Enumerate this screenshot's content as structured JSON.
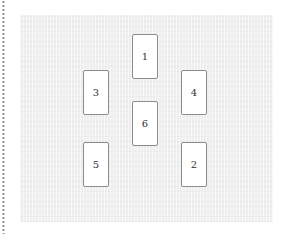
{
  "spread": {
    "cards": [
      {
        "id": "card-1",
        "label": "1"
      },
      {
        "id": "card-2",
        "label": "2"
      },
      {
        "id": "card-3",
        "label": "3"
      },
      {
        "id": "card-4",
        "label": "4"
      },
      {
        "id": "card-5",
        "label": "5"
      },
      {
        "id": "card-6",
        "label": "6"
      }
    ]
  }
}
